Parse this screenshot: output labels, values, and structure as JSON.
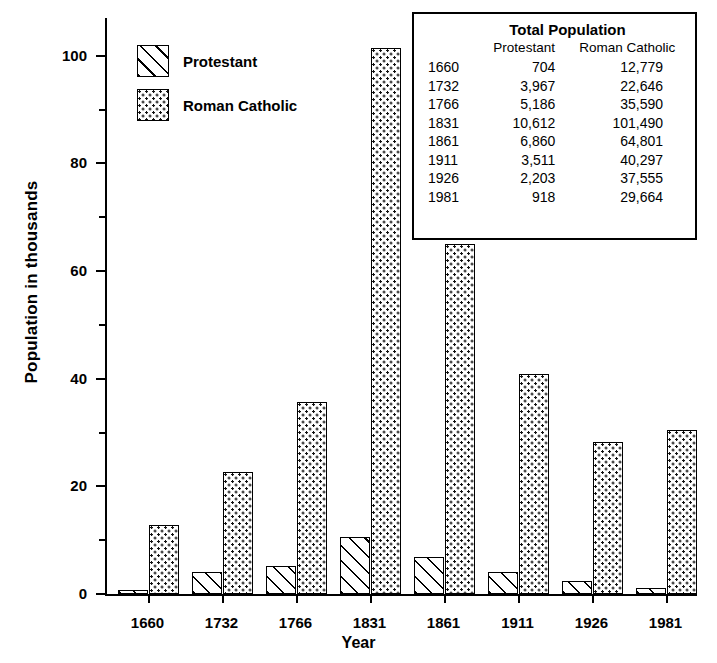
{
  "chart_data": {
    "type": "bar",
    "title": "",
    "xlabel": "Year",
    "ylabel": "Population in thousands",
    "categories": [
      "1660",
      "1732",
      "1766",
      "1831",
      "1861",
      "1911",
      "1926",
      "1981"
    ],
    "series": [
      {
        "name": "Protestant",
        "fill": "diagonal-hatch",
        "values": [
          0.7,
          4.0,
          5.2,
          10.6,
          6.9,
          4.0,
          2.5,
          1.2
        ]
      },
      {
        "name": "Roman Catholic",
        "fill": "dotted-stipple",
        "values": [
          12.8,
          22.6,
          35.6,
          101.5,
          65.0,
          40.8,
          28.2,
          30.5
        ]
      }
    ],
    "ylim": [
      0,
      107
    ],
    "ytick_major": [
      0,
      20,
      40,
      60,
      80,
      100
    ],
    "ytick_minor": [
      10,
      30,
      50,
      70,
      90
    ],
    "ytick_labels": [
      "0",
      "20",
      "40",
      "60",
      "80",
      "100"
    ],
    "grid": false,
    "legend_position": "upper-left",
    "legend": [
      "Protestant",
      "Roman Catholic"
    ]
  },
  "legend": {
    "items": [
      {
        "label": "Protestant",
        "swatch": "diagonal-hatch-swatch"
      },
      {
        "label": "Roman Catholic",
        "swatch": "dotted-stipple-swatch"
      }
    ]
  },
  "table": {
    "title": "Total Population",
    "headers": [
      "",
      "Protestant",
      "Roman Catholic"
    ],
    "rows": [
      {
        "year": "1660",
        "protestant": "704",
        "catholic": "12,779"
      },
      {
        "year": "1732",
        "protestant": "3,967",
        "catholic": "22,646"
      },
      {
        "year": "1766",
        "protestant": "5,186",
        "catholic": "35,590"
      },
      {
        "year": "1831",
        "protestant": "10,612",
        "catholic": "101,490"
      },
      {
        "year": "1861",
        "protestant": "6,860",
        "catholic": "64,801"
      },
      {
        "year": "1911",
        "protestant": "3,511",
        "catholic": "40,297"
      },
      {
        "year": "1926",
        "protestant": "2,203",
        "catholic": "37,555"
      },
      {
        "year": "1981",
        "protestant": "918",
        "catholic": "29,664"
      }
    ]
  },
  "colors": {
    "ink": "#000000",
    "background": "#ffffff"
  }
}
